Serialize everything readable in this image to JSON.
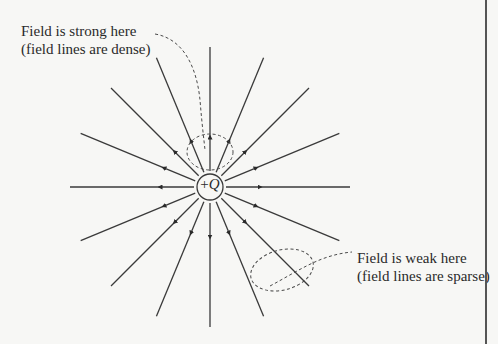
{
  "labels": {
    "strong": {
      "line1": "Field is strong here",
      "line2": "(field lines are dense)"
    },
    "weak": {
      "line1": "Field is weak here",
      "line2": "(field lines are sparse)"
    }
  },
  "charge": {
    "sign": "+",
    "symbol": "Q"
  },
  "field": {
    "line_count": 16,
    "direction": "outward",
    "center": [
      210,
      187
    ],
    "charge_radius": 13,
    "line_length": 140,
    "line_color": "#3a3a3a",
    "dash_color": "#4a4a4a"
  }
}
